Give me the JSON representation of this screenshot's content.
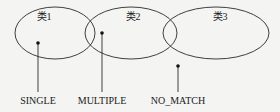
{
  "diagram": {
    "sets": [
      {
        "label": "类1",
        "cx": 55,
        "cy": 33,
        "rx": 40,
        "ry": 26,
        "label_x": 44,
        "label_y": 18
      },
      {
        "label": "类2",
        "cx": 131,
        "cy": 33,
        "rx": 46,
        "ry": 26,
        "label_x": 133,
        "label_y": 18
      },
      {
        "label": "类3",
        "cx": 216,
        "cy": 33,
        "rx": 53,
        "ry": 26,
        "label_x": 220,
        "label_y": 18
      }
    ],
    "markers": [
      {
        "label": "SINGLE",
        "dot_x": 38,
        "dot_y": 43,
        "line_end_y": 92,
        "label_x": 38,
        "label_y": 96
      },
      {
        "label": "MULTIPLE",
        "dot_x": 102,
        "dot_y": 33,
        "line_end_y": 92,
        "label_x": 102,
        "label_y": 96
      },
      {
        "label": "NO_MATCH",
        "dot_x": 178,
        "dot_y": 66,
        "line_end_y": 92,
        "label_x": 178,
        "label_y": 96
      }
    ],
    "stroke_color": "#2a2a2a",
    "background": "#f4f4f2"
  }
}
